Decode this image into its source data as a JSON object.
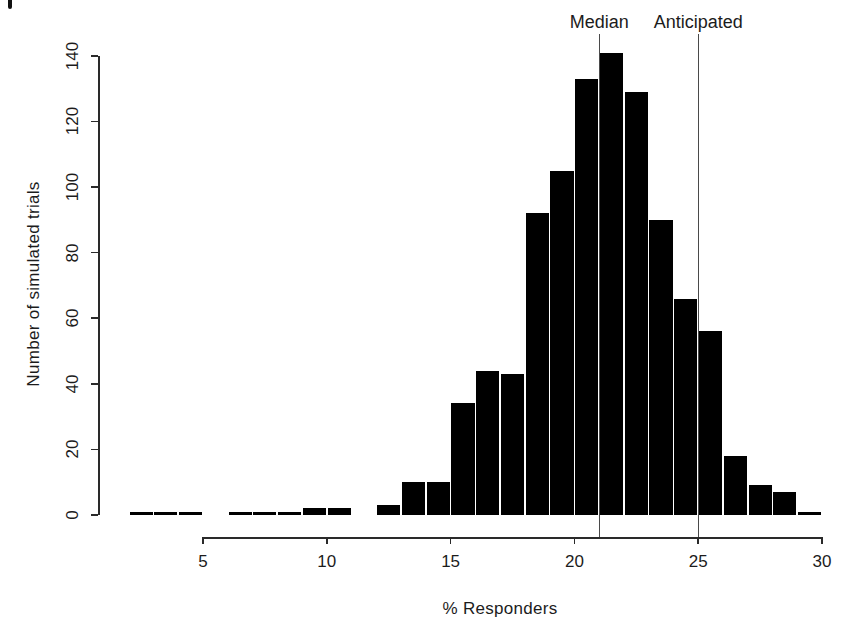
{
  "figure": {
    "background_color": "#ffffff",
    "bar_color": "#000000",
    "text_color": "#1c1c1c",
    "axis_color": "#2a2a2a",
    "ref_line_color": "#4a4a4a"
  },
  "chart_data": {
    "type": "bar",
    "subtype": "histogram",
    "title": "",
    "xlabel": "% Responders",
    "ylabel": "Number of simulated trials",
    "x_tick_labels": [
      "5",
      "10",
      "15",
      "20",
      "25",
      "30"
    ],
    "x_tick_values": [
      5,
      10,
      15,
      20,
      25,
      30
    ],
    "y_tick_labels": [
      "0",
      "20",
      "40",
      "60",
      "80",
      "100",
      "120",
      "140"
    ],
    "y_tick_values": [
      0,
      20,
      40,
      60,
      80,
      100,
      120,
      140
    ],
    "xlim": [
      2,
      30
    ],
    "ylim": [
      0,
      140
    ],
    "bin_width": 1,
    "bin_left_edges": [
      2,
      3,
      4,
      5,
      6,
      7,
      8,
      9,
      10,
      11,
      12,
      13,
      14,
      15,
      16,
      17,
      18,
      19,
      20,
      21,
      22,
      23,
      24,
      25,
      26,
      27,
      28,
      29
    ],
    "values": [
      1,
      1,
      1,
      0,
      1,
      1,
      1,
      2,
      2,
      0,
      3,
      10,
      10,
      34,
      44,
      43,
      92,
      105,
      133,
      141,
      129,
      90,
      66,
      56,
      18,
      9,
      7,
      1
    ],
    "legend": null,
    "grid": false,
    "annotations": [
      {
        "label": "Median",
        "x": 21
      },
      {
        "label": "Anticipated",
        "x": 25
      }
    ]
  }
}
